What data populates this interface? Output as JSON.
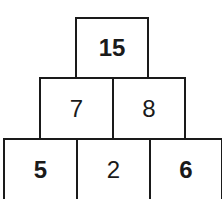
{
  "pyramid": {
    "rows": [
      {
        "cells": [
          {
            "value": "15",
            "bold": true
          }
        ]
      },
      {
        "cells": [
          {
            "value": "7",
            "bold": false
          },
          {
            "value": "8",
            "bold": false
          }
        ]
      },
      {
        "cells": [
          {
            "value": "5",
            "bold": true
          },
          {
            "value": "2",
            "bold": false
          },
          {
            "value": "6",
            "bold": true
          }
        ]
      }
    ]
  },
  "colors": {
    "line": "#1a1a1a",
    "text": "#1a1a1a",
    "background": "#ffffff"
  }
}
